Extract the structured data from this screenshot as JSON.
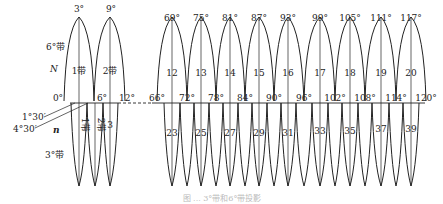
{
  "colors": {
    "line": "#222222",
    "background": "#ffffff"
  },
  "left_labels": {
    "six_degree_zone": "6°带",
    "six_degree_symbol": "N",
    "three_degree_zone": "3°带",
    "three_degree_symbol": "n",
    "offset_1": "1°30′",
    "offset_2": "4°30′"
  },
  "six_degree_zones": [
    {
      "number": "1带",
      "central_meridian": "3°"
    },
    {
      "number": "2带",
      "central_meridian": "9°"
    },
    {
      "number": "12",
      "central_meridian": "69°"
    },
    {
      "number": "13",
      "central_meridian": "75°"
    },
    {
      "number": "14",
      "central_meridian": "81°"
    },
    {
      "number": "15",
      "central_meridian": "87°"
    },
    {
      "number": "16",
      "central_meridian": "93°"
    },
    {
      "number": "17",
      "central_meridian": "99°"
    },
    {
      "number": "18",
      "central_meridian": "105°"
    },
    {
      "number": "19",
      "central_meridian": "111°"
    },
    {
      "number": "20",
      "central_meridian": "117°"
    }
  ],
  "boundary_meridians": [
    "0°",
    "6°",
    "12°",
    "66°",
    "72°",
    "78°",
    "84°",
    "90°",
    "96°",
    "102°",
    "108°",
    "114°",
    "120°"
  ],
  "three_degree_zones": [
    "1带",
    "2带",
    "3",
    "23",
    "25",
    "27",
    "29",
    "31",
    "33",
    "35",
    "37",
    "39"
  ],
  "caption": "图 ... 3°带和6°带投影"
}
